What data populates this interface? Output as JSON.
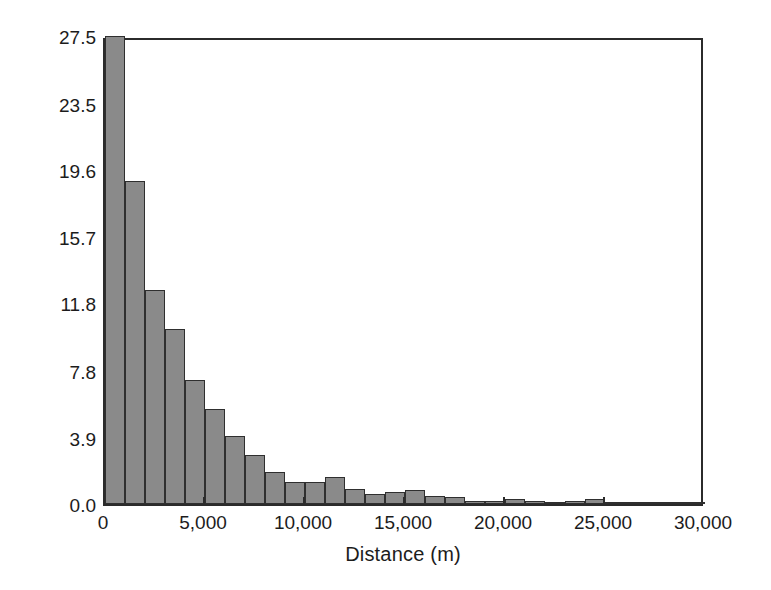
{
  "chart_data": {
    "type": "bar",
    "title": "",
    "xlabel": "Distance (m)",
    "ylabel": "Percentage",
    "xlim": [
      0,
      30000
    ],
    "ylim": [
      0.0,
      27.5
    ],
    "grid": false,
    "legend": null,
    "bin_width": 1000,
    "bar_color": "#8a8a8a",
    "bar_edge_color": "#2f2f2f",
    "axis_color": "#2b2b2b",
    "background_color": "#ffffff",
    "x_ticks": [
      {
        "value": 0,
        "label": "0"
      },
      {
        "value": 5000,
        "label": "5,000"
      },
      {
        "value": 10000,
        "label": "10,000"
      },
      {
        "value": 15000,
        "label": "15,000"
      },
      {
        "value": 20000,
        "label": "20,000"
      },
      {
        "value": 25000,
        "label": "25,000"
      },
      {
        "value": 30000,
        "label": "30,000"
      }
    ],
    "y_ticks": [
      {
        "value": 0.0,
        "label": "0.0"
      },
      {
        "value": 3.9,
        "label": "3.9"
      },
      {
        "value": 7.8,
        "label": "7.8"
      },
      {
        "value": 11.8,
        "label": "11.8"
      },
      {
        "value": 15.7,
        "label": "15.7"
      },
      {
        "value": 19.6,
        "label": "19.6"
      },
      {
        "value": 23.5,
        "label": "23.5"
      },
      {
        "value": 27.5,
        "label": "27.5"
      }
    ],
    "bins": [
      {
        "x0": 0,
        "x1": 1000,
        "value": 27.5
      },
      {
        "x0": 1000,
        "x1": 2000,
        "value": 19.0
      },
      {
        "x0": 2000,
        "x1": 3000,
        "value": 12.6
      },
      {
        "x0": 3000,
        "x1": 4000,
        "value": 10.3
      },
      {
        "x0": 4000,
        "x1": 5000,
        "value": 7.3
      },
      {
        "x0": 5000,
        "x1": 6000,
        "value": 5.6
      },
      {
        "x0": 6000,
        "x1": 7000,
        "value": 4.0
      },
      {
        "x0": 7000,
        "x1": 8000,
        "value": 2.9
      },
      {
        "x0": 8000,
        "x1": 9000,
        "value": 1.9
      },
      {
        "x0": 9000,
        "x1": 10000,
        "value": 1.3
      },
      {
        "x0": 10000,
        "x1": 11000,
        "value": 1.3
      },
      {
        "x0": 11000,
        "x1": 12000,
        "value": 1.6
      },
      {
        "x0": 12000,
        "x1": 13000,
        "value": 0.9
      },
      {
        "x0": 13000,
        "x1": 14000,
        "value": 0.6
      },
      {
        "x0": 14000,
        "x1": 15000,
        "value": 0.7
      },
      {
        "x0": 15000,
        "x1": 16000,
        "value": 0.8
      },
      {
        "x0": 16000,
        "x1": 17000,
        "value": 0.5
      },
      {
        "x0": 17000,
        "x1": 18000,
        "value": 0.4
      },
      {
        "x0": 18000,
        "x1": 19000,
        "value": 0.2
      },
      {
        "x0": 19000,
        "x1": 20000,
        "value": 0.2
      },
      {
        "x0": 20000,
        "x1": 21000,
        "value": 0.3
      },
      {
        "x0": 21000,
        "x1": 22000,
        "value": 0.2
      },
      {
        "x0": 22000,
        "x1": 23000,
        "value": 0.1
      },
      {
        "x0": 23000,
        "x1": 24000,
        "value": 0.2
      },
      {
        "x0": 24000,
        "x1": 25000,
        "value": 0.3
      },
      {
        "x0": 25000,
        "x1": 26000,
        "value": 0.1
      },
      {
        "x0": 26000,
        "x1": 27000,
        "value": 0.05
      },
      {
        "x0": 27000,
        "x1": 28000,
        "value": 0.05
      },
      {
        "x0": 28000,
        "x1": 29000,
        "value": 0.05
      },
      {
        "x0": 29000,
        "x1": 30000,
        "value": 0.05
      }
    ]
  }
}
